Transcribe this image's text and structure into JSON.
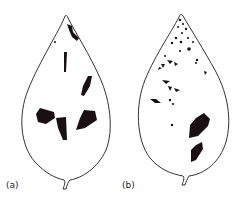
{
  "figure": {
    "panels": [
      {
        "id": "a",
        "label": "(a)",
        "description": "leaf with few large dark lesions"
      },
      {
        "id": "b",
        "label": "(b)",
        "description": "leaf with many small dark spots near tip and large lesions lower right"
      }
    ],
    "colors": {
      "outline": "#333333",
      "lesion": "#1a1014",
      "background": "#ffffff"
    }
  }
}
